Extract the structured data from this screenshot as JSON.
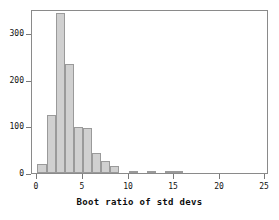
{
  "chart_data": {
    "type": "bar",
    "title": "",
    "xlabel": "Boot ratio of std devs",
    "ylabel": "",
    "xlim": [
      -0.6,
      25.4
    ],
    "ylim": [
      0,
      351
    ],
    "grid": false,
    "legend": null,
    "bin_width": 1,
    "bar_color": "#d0d0d0",
    "bar_edge_color": "#9a9a9a",
    "xticks": [
      0,
      5,
      10,
      15,
      20,
      25
    ],
    "xtick_labels": [
      "0",
      "5",
      "10",
      "15",
      "20",
      "25"
    ],
    "yticks": [
      0,
      100,
      200,
      300
    ],
    "ytick_labels": [
      "0",
      "100",
      "200",
      "300"
    ],
    "bins": [
      {
        "left": 0,
        "right": 1,
        "value": 19
      },
      {
        "left": 1,
        "right": 2,
        "value": 124
      },
      {
        "left": 2,
        "right": 3,
        "value": 343
      },
      {
        "left": 3,
        "right": 4,
        "value": 234
      },
      {
        "left": 4,
        "right": 5,
        "value": 99
      },
      {
        "left": 5,
        "right": 6,
        "value": 97
      },
      {
        "left": 6,
        "right": 7,
        "value": 43
      },
      {
        "left": 7,
        "right": 8,
        "value": 26
      },
      {
        "left": 8,
        "right": 9,
        "value": 16
      },
      {
        "left": 10,
        "right": 11,
        "value": 3
      },
      {
        "left": 12,
        "right": 13,
        "value": 3
      },
      {
        "left": 14,
        "right": 16,
        "value": 3
      }
    ],
    "categories": [
      "0-1",
      "1-2",
      "2-3",
      "3-4",
      "4-5",
      "5-6",
      "6-7",
      "7-8",
      "8-9",
      "10-11",
      "12-13",
      "14-16"
    ],
    "values": [
      19,
      124,
      343,
      234,
      99,
      97,
      43,
      26,
      16,
      3,
      3,
      3
    ]
  },
  "axis": {
    "x_title": "Boot ratio of std devs"
  }
}
